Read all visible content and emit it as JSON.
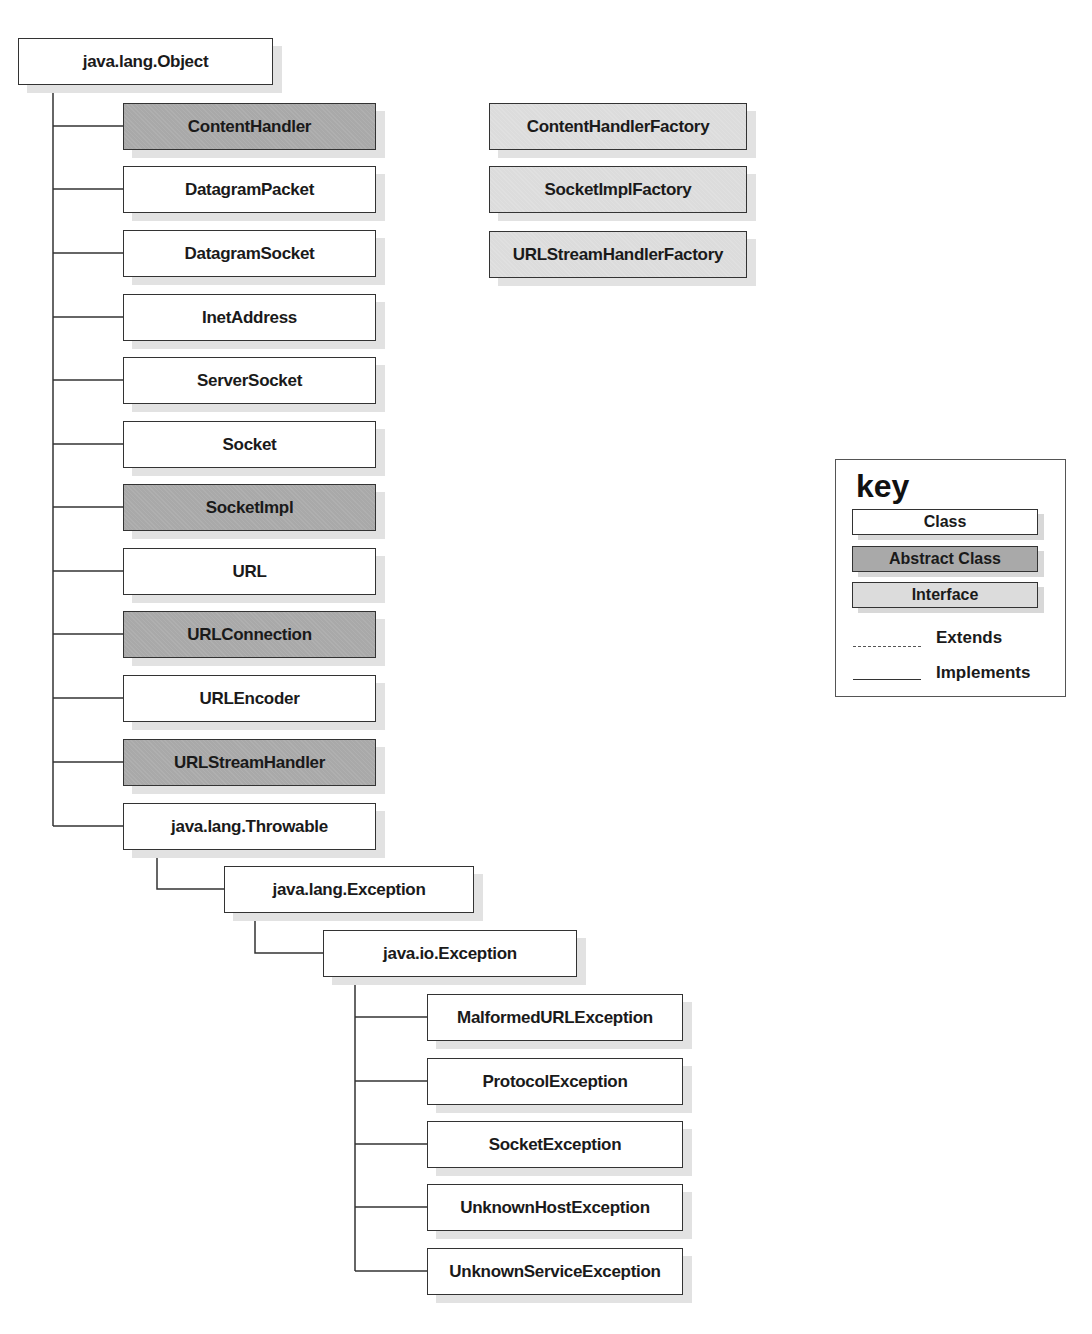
{
  "diagram": {
    "root": {
      "label": "java.lang.Object",
      "kind": "class"
    },
    "object_children": [
      {
        "label": "ContentHandler",
        "kind": "abstract"
      },
      {
        "label": "DatagramPacket",
        "kind": "class"
      },
      {
        "label": "DatagramSocket",
        "kind": "class"
      },
      {
        "label": "InetAddress",
        "kind": "class"
      },
      {
        "label": "ServerSocket",
        "kind": "class"
      },
      {
        "label": "Socket",
        "kind": "class"
      },
      {
        "label": "SocketImpl",
        "kind": "abstract"
      },
      {
        "label": "URL",
        "kind": "class"
      },
      {
        "label": "URLConnection",
        "kind": "abstract"
      },
      {
        "label": "URLEncoder",
        "kind": "class"
      },
      {
        "label": "URLStreamHandler",
        "kind": "abstract"
      },
      {
        "label": "java.lang.Throwable",
        "kind": "class"
      }
    ],
    "throwable_child": {
      "label": "java.lang.Exception",
      "kind": "class"
    },
    "exception_child": {
      "label": "java.io.Exception",
      "kind": "class"
    },
    "io_exception_children": [
      {
        "label": "MalformedURLException",
        "kind": "class"
      },
      {
        "label": "ProtocolException",
        "kind": "class"
      },
      {
        "label": "SocketException",
        "kind": "class"
      },
      {
        "label": "UnknownHostException",
        "kind": "class"
      },
      {
        "label": "UnknownServiceException",
        "kind": "class"
      }
    ],
    "interfaces": [
      {
        "label": "ContentHandlerFactory",
        "kind": "interface"
      },
      {
        "label": "SocketImplFactory",
        "kind": "interface"
      },
      {
        "label": "URLStreamHandlerFactory",
        "kind": "interface"
      }
    ]
  },
  "key": {
    "title": "key",
    "class_label": "Class",
    "abstract_label": "Abstract Class",
    "interface_label": "Interface",
    "extends_label": "Extends",
    "implements_label": "Implements"
  },
  "colors": {
    "class_fill": "#ffffff",
    "abstract_fill": "#a9a9a9",
    "interface_fill": "#dcdcdc",
    "line": "#333333",
    "shadow": "#e2e2e2"
  }
}
